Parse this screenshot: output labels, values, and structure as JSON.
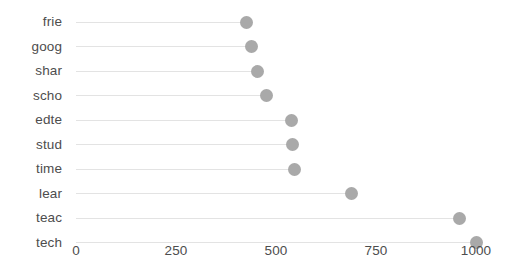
{
  "chart_data": {
    "type": "scatter",
    "variant": "lollipop-horizontal",
    "title": "",
    "subtitle": "",
    "xlabel": "",
    "ylabel": "",
    "categories": [
      "frie",
      "goog",
      "shar",
      "scho",
      "edte",
      "stud",
      "time",
      "lear",
      "teac",
      "tech"
    ],
    "values": [
      425,
      438,
      453,
      475,
      538,
      540,
      545,
      688,
      958,
      1000
    ],
    "points": [
      {
        "category": "frie",
        "value": 425
      },
      {
        "category": "goog",
        "value": 438
      },
      {
        "category": "shar",
        "value": 453
      },
      {
        "category": "scho",
        "value": 475
      },
      {
        "category": "edte",
        "value": 538
      },
      {
        "category": "stud",
        "value": 540
      },
      {
        "category": "time",
        "value": 545
      },
      {
        "category": "lear",
        "value": 688
      },
      {
        "category": "teac",
        "value": 958
      },
      {
        "category": "tech",
        "value": 1000
      }
    ],
    "xlim": [
      0,
      1070
    ],
    "xticks": [
      0,
      250,
      500,
      750,
      1000
    ],
    "xtick_labels": [
      "0",
      "250",
      "500",
      "750",
      "1000"
    ],
    "grid": false,
    "legend": false,
    "legend_position": "none",
    "marker_color": "#a9a9a9",
    "stem_color": "#e3e3e3",
    "background_color": "#ffffff",
    "text_color": "#4d4d4d",
    "marker_size": 13,
    "sort_order": "ascending-by-value"
  },
  "axis": {
    "x_tick_0": "0",
    "x_tick_1": "250",
    "x_tick_2": "500",
    "x_tick_3": "750",
    "x_tick_4": "1000"
  }
}
